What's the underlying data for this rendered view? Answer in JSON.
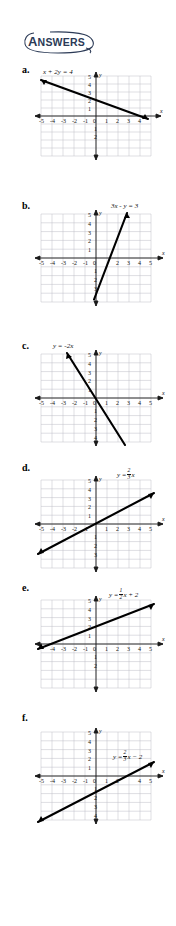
{
  "header": {
    "title": "ANSWERS",
    "title_first_letter": "A",
    "title_rest": "NSWERS",
    "accent_color": "#2b3a56",
    "swoosh_icon": "oval-swoosh-icon"
  },
  "axis": {
    "x_tick_labels": [
      "-5",
      "-4",
      "-3",
      "-2",
      "-1",
      "0",
      "1",
      "2",
      "3",
      "4",
      "5"
    ],
    "y_tick_labels_positive": [
      "1",
      "2",
      "3",
      "4",
      "5"
    ],
    "y_tick_labels_negative": [
      "1",
      "2",
      "3",
      "4",
      "5"
    ],
    "x_axis_name": "x",
    "y_axis_name": "y",
    "origin_label": "0",
    "grid_color": "#b9b9c4",
    "axis_color": "#1a1a1a",
    "line_color": "#000000"
  },
  "graphs": [
    {
      "key": "a",
      "letter": "a.",
      "equation_plain": "x + 2y = 4",
      "equation_parts": {
        "lhs": "x + 2y",
        "rel": "=",
        "rhs": "4"
      },
      "label_position": "upper-left",
      "slope": -0.5,
      "intercept": 2,
      "endpoints": [
        {
          "x": -5,
          "y": 4.5
        },
        {
          "x": 4.7,
          "y": -0.35
        }
      ],
      "x_intercept": 4,
      "y_intercept": 2
    },
    {
      "key": "b",
      "letter": "b.",
      "equation_plain": "3x - y = 3",
      "equation_parts": {
        "lhs": "3x − y",
        "rel": "=",
        "rhs": "3"
      },
      "label_position": "upper-right",
      "slope": 3,
      "intercept": -3,
      "endpoints": [
        {
          "x": -0.2,
          "y": -3.6
        },
        {
          "x": 2.75,
          "y": 5.25
        }
      ],
      "x_intercept": 1,
      "y_intercept": -3
    },
    {
      "key": "c",
      "letter": "c.",
      "equation_plain": "y = -2x",
      "equation_parts": {
        "lhs": "y",
        "rel": "=",
        "rhs": "−2x"
      },
      "label_position": "upper-left",
      "slope": -2,
      "intercept": 0,
      "endpoints": [
        {
          "x": -2.65,
          "y": 5.3
        },
        {
          "x": 2.65,
          "y": -5.3
        }
      ],
      "x_intercept": 0,
      "y_intercept": 0
    },
    {
      "key": "d",
      "letter": "d.",
      "equation_plain": "y = 2/3 x",
      "equation_parts": {
        "lhs": "y",
        "rel": "=",
        "num": "2",
        "den": "3",
        "var": "x"
      },
      "label_position": "upper-right",
      "slope": 0.6667,
      "intercept": 0,
      "endpoints": [
        {
          "x": -5.3,
          "y": -3.55
        },
        {
          "x": 5.3,
          "y": 3.55
        }
      ],
      "x_intercept": 0,
      "y_intercept": 0
    },
    {
      "key": "e",
      "letter": "e.",
      "equation_plain": "y = 1/2 x + 2",
      "equation_parts": {
        "lhs": "y",
        "rel": "=",
        "num": "1",
        "den": "2",
        "var": "x",
        "tail": "+ 2"
      },
      "label_position": "upper-right",
      "slope": 0.5,
      "intercept": 2,
      "endpoints": [
        {
          "x": -5.3,
          "y": -0.65
        },
        {
          "x": 5.3,
          "y": 4.65
        }
      ],
      "x_intercept": -4,
      "y_intercept": 2
    },
    {
      "key": "f",
      "letter": "f.",
      "equation_plain": "y = 2/3 x - 2",
      "equation_parts": {
        "lhs": "y",
        "rel": "=",
        "num": "2",
        "den": "3",
        "var": "x",
        "tail": "− 2"
      },
      "label_position": "right-middle",
      "slope": 0.6667,
      "intercept": -2,
      "endpoints": [
        {
          "x": -5.3,
          "y": -5.3
        },
        {
          "x": 5.3,
          "y": 1.55
        }
      ],
      "x_intercept": 3,
      "y_intercept": -2
    }
  ]
}
